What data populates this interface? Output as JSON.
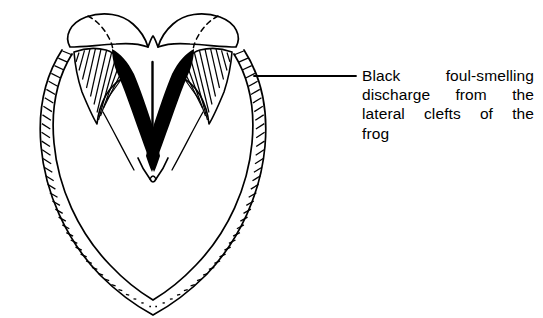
{
  "figure": {
    "background_color": "#ffffff",
    "ink_color": "#000000",
    "parts": {
      "heel_bulbs": "heel-bulbs",
      "hoof_wall": "hoof-wall-band",
      "sole": "sole-region",
      "frog": "frog-region",
      "central_sulcus": "central-sulcus-line",
      "lateral_clefts": "black-discharge-clefts",
      "bars": "bars-of-hoof"
    },
    "leader_line": {
      "from_x": 254,
      "from_y": 76,
      "to_x": 356,
      "to_y": 76
    }
  },
  "annotation": {
    "lines": [
      {
        "words": [
          "Black",
          "foul-smelling"
        ],
        "justified": true
      },
      {
        "words": [
          "discharge",
          "from",
          "the"
        ],
        "justified": true
      },
      {
        "words": [
          "lateral",
          "clefts",
          "of",
          "the"
        ],
        "justified": true
      },
      {
        "words": [
          "frog"
        ],
        "justified": false
      }
    ],
    "full_text": "Black foul-smelling discharge from the lateral clefts of the frog"
  }
}
